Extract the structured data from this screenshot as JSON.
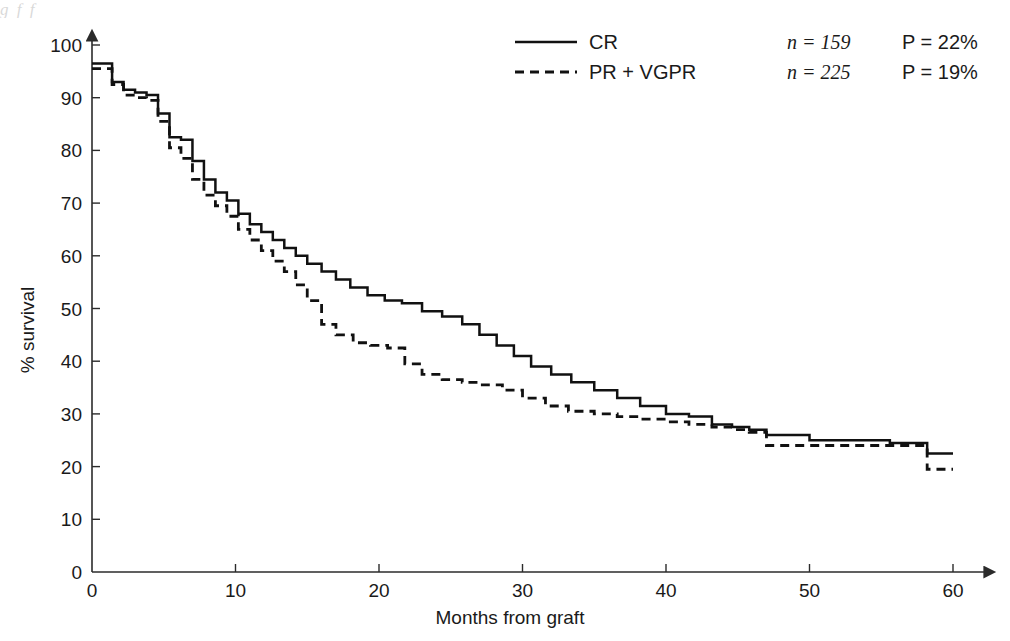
{
  "figure": {
    "caption_fragment": "g      f                 f"
  },
  "legend": {
    "position": "top-right",
    "entries": [
      {
        "label": "CR",
        "style": "solid",
        "n_label": "n = 159",
        "p_label": "P = 22%"
      },
      {
        "label": "PR + VGPR",
        "style": "dashed",
        "n_label": "n = 225",
        "p_label": "P = 19%"
      }
    ]
  },
  "chart_data": {
    "type": "line",
    "title": "",
    "subtitle": "",
    "xlabel": "Months from graft",
    "ylabel": "% survival",
    "xlim": [
      0,
      60
    ],
    "ylim": [
      0,
      100
    ],
    "xticks": [
      0,
      10,
      20,
      30,
      40,
      50,
      60
    ],
    "yticks": [
      0,
      10,
      20,
      30,
      40,
      50,
      60,
      70,
      80,
      90,
      100
    ],
    "grid": false,
    "step_type": "post",
    "annotations": [],
    "series": [
      {
        "name": "CR",
        "style": "solid",
        "n": 159,
        "p_percent": 22,
        "x": [
          0,
          0.6,
          1.4,
          2.2,
          3.0,
          3.8,
          4.6,
          5.4,
          6.2,
          7.0,
          7.8,
          8.6,
          9.4,
          10.2,
          11.0,
          11.8,
          12.6,
          13.4,
          14.2,
          15.0,
          16.0,
          17.0,
          18.0,
          19.2,
          20.4,
          21.6,
          23.0,
          24.4,
          25.8,
          27.0,
          28.2,
          29.4,
          30.6,
          32.0,
          33.4,
          35.0,
          36.6,
          38.2,
          40.0,
          41.6,
          43.2,
          44.6,
          45.8,
          47.0,
          50.0,
          53.0,
          55.6,
          57.0,
          58.2,
          60.0
        ],
        "y": [
          96.5,
          96.5,
          93.0,
          91.5,
          91.0,
          90.5,
          87.0,
          82.5,
          82.0,
          78.0,
          74.5,
          72.0,
          70.5,
          68.0,
          66.0,
          64.5,
          63.0,
          61.5,
          60.0,
          58.5,
          57.0,
          55.5,
          54.0,
          52.5,
          51.5,
          51.0,
          49.5,
          48.5,
          47.0,
          45.0,
          43.0,
          41.0,
          39.0,
          37.5,
          36.0,
          34.5,
          33.0,
          31.5,
          30.0,
          29.5,
          28.0,
          27.5,
          27.0,
          26.0,
          25.0,
          25.0,
          24.5,
          24.5,
          22.5,
          22.5
        ]
      },
      {
        "name": "PR + VGPR",
        "style": "dashed",
        "n": 225,
        "p_percent": 19,
        "x": [
          0,
          0.6,
          1.4,
          2.2,
          3.0,
          3.8,
          4.6,
          5.4,
          6.2,
          7.0,
          7.8,
          8.6,
          9.4,
          10.2,
          11.0,
          11.8,
          12.6,
          13.4,
          14.2,
          15.0,
          16.0,
          17.0,
          18.2,
          19.4,
          20.6,
          21.8,
          23.0,
          24.4,
          25.8,
          27.2,
          28.6,
          30.0,
          31.6,
          33.2,
          35.0,
          36.6,
          38.2,
          40.0,
          41.6,
          43.2,
          44.6,
          45.8,
          47.0,
          50.0,
          53.0,
          55.6,
          57.0,
          58.2,
          60.0
        ],
        "y": [
          95.5,
          95.5,
          92.5,
          90.5,
          90.0,
          89.5,
          85.5,
          80.5,
          78.5,
          74.5,
          71.5,
          69.5,
          67.5,
          65.0,
          63.0,
          61.0,
          59.0,
          57.0,
          54.5,
          51.5,
          47.0,
          45.0,
          43.5,
          43.0,
          42.5,
          39.5,
          37.5,
          36.5,
          36.0,
          35.5,
          34.5,
          33.0,
          31.5,
          30.5,
          30.0,
          29.5,
          29.0,
          28.5,
          28.0,
          27.5,
          27.0,
          26.5,
          24.0,
          24.0,
          24.0,
          24.0,
          24.0,
          19.5,
          19.5
        ]
      }
    ]
  }
}
